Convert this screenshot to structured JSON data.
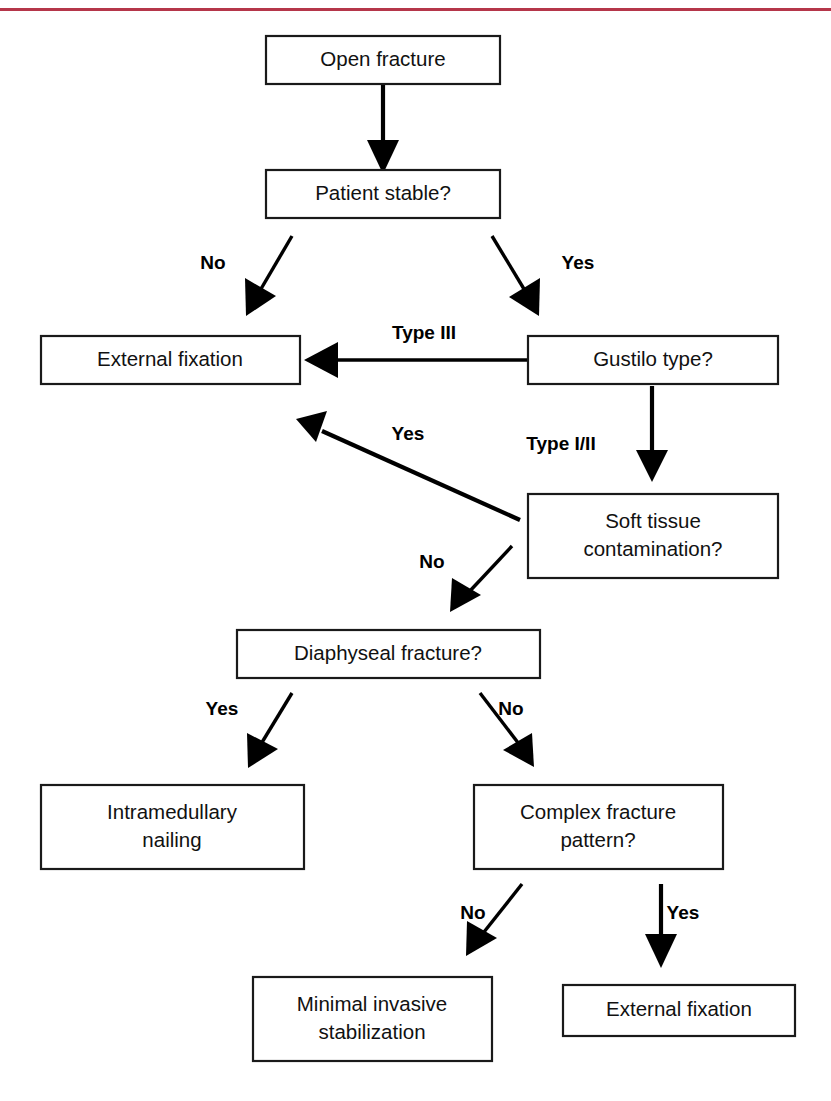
{
  "figure": {
    "accent_rule_color": "#b5364a",
    "background_color": "#ffffff",
    "line_color": "#000000",
    "box_border_color": "#1a1a1a"
  },
  "nodes": [
    {
      "id": "open-fracture",
      "label": "Open fracture",
      "label2": "",
      "x": 266,
      "y": 36,
      "w": 234,
      "h": 48
    },
    {
      "id": "patient-stable",
      "label": "Patient stable?",
      "label2": "",
      "x": 266,
      "y": 170,
      "w": 234,
      "h": 48
    },
    {
      "id": "external-fixation-1",
      "label": "External fixation",
      "label2": "",
      "x": 41,
      "y": 336,
      "w": 259,
      "h": 48
    },
    {
      "id": "gustilo-type",
      "label": "Gustilo type?",
      "label2": "",
      "x": 528,
      "y": 336,
      "w": 250,
      "h": 48
    },
    {
      "id": "soft-tissue",
      "label": "Soft tissue",
      "label2": "contamination?",
      "x": 528,
      "y": 494,
      "w": 250,
      "h": 84
    },
    {
      "id": "diaphyseal-fracture",
      "label": "Diaphyseal fracture?",
      "label2": "",
      "x": 237,
      "y": 630,
      "w": 303,
      "h": 48
    },
    {
      "id": "intramedullary",
      "label": "Intramedullary",
      "label2": "nailing",
      "x": 41,
      "y": 785,
      "w": 263,
      "h": 84
    },
    {
      "id": "complex-pattern",
      "label": "Complex fracture",
      "label2": "pattern?",
      "x": 474,
      "y": 785,
      "w": 249,
      "h": 84
    },
    {
      "id": "minimal-invasive",
      "label": "Minimal invasive",
      "label2": "stabilization",
      "x": 253,
      "y": 977,
      "w": 239,
      "h": 84
    },
    {
      "id": "external-fixation-2",
      "label": "External fixation",
      "label2": "",
      "x": 563,
      "y": 985,
      "w": 232,
      "h": 51
    }
  ],
  "edges": [
    {
      "id": "e-open-to-stable",
      "from": "open-fracture",
      "to": "patient-stable",
      "label": "",
      "label_x": 0,
      "label_y": 0
    },
    {
      "id": "e-stable-no-extfix",
      "from": "patient-stable",
      "to": "external-fixation-1",
      "label": "No",
      "label_x": 213,
      "label_y": 262
    },
    {
      "id": "e-stable-yes-gustilo",
      "from": "patient-stable",
      "to": "gustilo-type",
      "label": "Yes",
      "label_x": 577,
      "label_y": 262
    },
    {
      "id": "e-gustilo-typeiii-extfix",
      "from": "gustilo-type",
      "to": "external-fixation-1",
      "label": "Type III",
      "label_x": 425,
      "label_y": 336
    },
    {
      "id": "e-gustilo-typeiii-soft",
      "from": "gustilo-type",
      "to": "soft-tissue",
      "label": "Type I/II",
      "label_x": 560,
      "label_y": 443
    },
    {
      "id": "e-soft-yes-extfix",
      "from": "soft-tissue",
      "to": "external-fixation-1",
      "label": "Yes",
      "label_x": 406,
      "label_y": 434
    },
    {
      "id": "e-soft-no-diaphyseal",
      "from": "soft-tissue",
      "to": "diaphyseal-fracture",
      "label": "No",
      "label_x": 432,
      "label_y": 562
    },
    {
      "id": "e-diaphyseal-yes-im",
      "from": "diaphyseal-fracture",
      "to": "intramedullary",
      "label": "Yes",
      "label_x": 223,
      "label_y": 710
    },
    {
      "id": "e-diaphyseal-no-complex",
      "from": "diaphyseal-fracture",
      "to": "complex-pattern",
      "label": "No",
      "label_x": 510,
      "label_y": 710
    },
    {
      "id": "e-complex-no-minimal",
      "from": "complex-pattern",
      "to": "minimal-invasive",
      "label": "No",
      "label_x": 473,
      "label_y": 913
    },
    {
      "id": "e-complex-yes-extfix",
      "from": "complex-pattern",
      "to": "external-fixation-2",
      "label": "Yes",
      "label_x": 681,
      "label_y": 913
    }
  ],
  "geometry": {
    "arrow_open_to_stable": {
      "path": "M 383 84 L 383 152",
      "head": "379,170 366,142 396,142"
    },
    "arrow_stable_no": {
      "path": "M 290 238 L 259 296",
      "head": "249,315 246,281 274,296"
    },
    "arrow_stable_yes": {
      "path": "M 492 238 L 525 296",
      "head": "535,315 510,295 539,282"
    },
    "arrow_typeiii": {
      "path": "M 528 359 L 332 359",
      "head": "305,359 336,342 336,377"
    },
    "arrow_typeiii_bar": {
      "path": "M 652 384 L 652 455",
      "head": "652,479 638,450 667,450"
    },
    "arrow_soft_yes": {
      "path": "M 518 518 L 320 430",
      "head": "296,419 326,414 314,442"
    },
    "arrow_soft_no": {
      "path": "M 510 548 L 468 592",
      "head": "450,610 451,579 478,594"
    },
    "arrow_diaph_yes": {
      "path": "M 290 695 L 262 745",
      "head": "250,766 248,733 277,747"
    },
    "arrow_diaph_no": {
      "path": "M 480 695 L 518 744",
      "head": "533,765 505,748 532,733"
    },
    "arrow_complex_no": {
      "path": "M 520 886 L 482 934",
      "head": "466,954 467,922 495,936"
    },
    "arrow_complex_yes": {
      "path": "M 661 886 L 661 940",
      "head": "661,963 647,935 676,935"
    }
  }
}
